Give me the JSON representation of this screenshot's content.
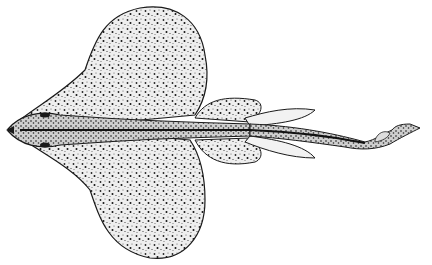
{
  "illustration": {
    "subject": "skate-like cartilaginous fish, dorsal view, stippled engraving",
    "colors": {
      "background": "#ffffff",
      "ink": "#1a1a1a",
      "body_fill": "#ededed"
    }
  }
}
